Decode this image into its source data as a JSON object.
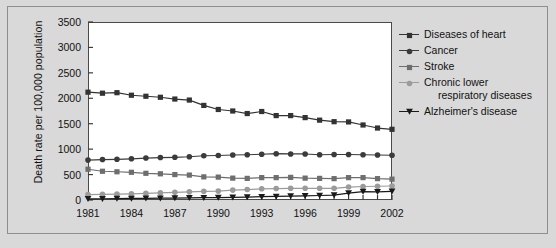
{
  "chart_data": {
    "type": "line",
    "title": "",
    "xlabel": "",
    "ylabel": "Death rate per 100,000 population",
    "x": [
      1981,
      1982,
      1983,
      1984,
      1985,
      1986,
      1987,
      1988,
      1989,
      1990,
      1991,
      1992,
      1993,
      1994,
      1995,
      1996,
      1997,
      1998,
      1999,
      2000,
      2001,
      2002
    ],
    "xlim": [
      1981,
      2002
    ],
    "ylim": [
      0,
      3500
    ],
    "ytick_labels": [
      "0",
      "500",
      "1000",
      "1500",
      "2000",
      "2500",
      "3000",
      "3500"
    ],
    "ytick_values": [
      0,
      500,
      1000,
      1500,
      2000,
      2500,
      3000,
      3500
    ],
    "xtick_labels": [
      "1981",
      "1984",
      "1987",
      "1990",
      "1993",
      "1996",
      "1999",
      "2002"
    ],
    "xtick_values": [
      1981,
      1984,
      1987,
      1990,
      1993,
      1996,
      1999,
      2002
    ],
    "grid": false,
    "legend_position": "right",
    "series": [
      {
        "name": "Diseases of heart",
        "marker": "square",
        "color": "#333333",
        "values": [
          2120,
          2100,
          2110,
          2060,
          2040,
          2020,
          1985,
          1965,
          1860,
          1780,
          1750,
          1700,
          1740,
          1660,
          1660,
          1620,
          1570,
          1540,
          1535,
          1475,
          1415,
          1390
        ]
      },
      {
        "name": "Cancer",
        "marker": "circle",
        "color": "#3b3b3b",
        "values": [
          785,
          795,
          800,
          810,
          825,
          835,
          840,
          850,
          870,
          875,
          885,
          890,
          900,
          910,
          905,
          905,
          890,
          895,
          895,
          890,
          885,
          880
        ]
      },
      {
        "name": "Stroke",
        "marker": "square",
        "color": "#6e6e6e",
        "values": [
          605,
          565,
          555,
          545,
          525,
          515,
          500,
          490,
          455,
          450,
          430,
          425,
          440,
          440,
          445,
          430,
          425,
          420,
          440,
          440,
          420,
          410
        ]
      },
      {
        "name": "Chronic lower respiratory diseases",
        "marker": "circle",
        "color": "#9b9b9b",
        "values": [
          105,
          110,
          115,
          120,
          130,
          140,
          150,
          160,
          170,
          175,
          195,
          205,
          220,
          225,
          230,
          230,
          230,
          230,
          255,
          265,
          270,
          275
        ]
      },
      {
        "name": "Alzheimer's disease",
        "marker": "triangle-down",
        "color": "#1a1a1a",
        "values": [
          22,
          25,
          28,
          30,
          33,
          35,
          38,
          42,
          45,
          48,
          52,
          58,
          65,
          70,
          78,
          82,
          88,
          95,
          135,
          165,
          160,
          170
        ]
      }
    ]
  },
  "legend": {
    "items": [
      {
        "label": "Diseases of heart",
        "label2": ""
      },
      {
        "label": "Cancer",
        "label2": ""
      },
      {
        "label": "Stroke",
        "label2": ""
      },
      {
        "label": "Chronic lower",
        "label2": "respiratory diseases"
      },
      {
        "label": "Alzheimer's disease",
        "label2": ""
      }
    ]
  }
}
